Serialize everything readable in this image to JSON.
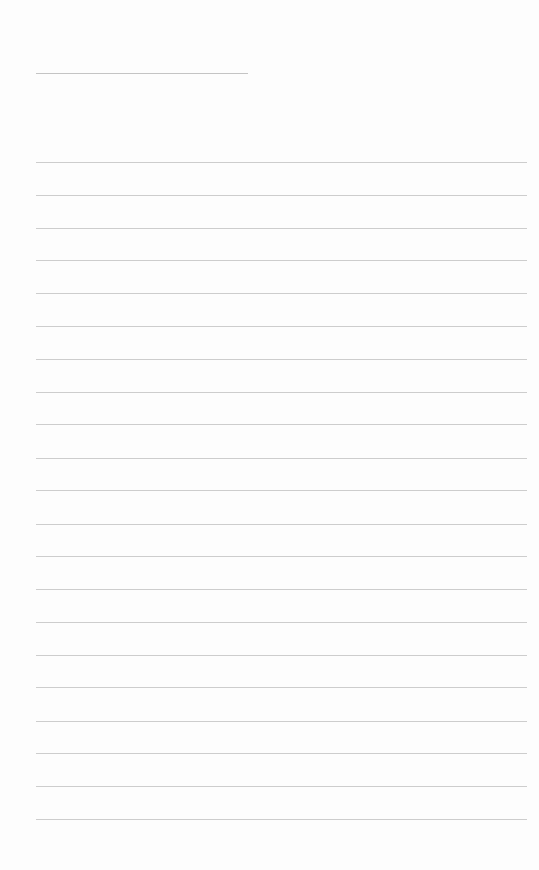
{
  "page": {
    "type": "lined-paper",
    "background_color": "#fdfdfd",
    "line_color": "#cdcdcd",
    "header_line": {
      "x1": 36,
      "x2": 248,
      "y": 73
    },
    "body_lines": {
      "x1": 36,
      "x2": 527,
      "y_positions": [
        162,
        195,
        228,
        260,
        293,
        326,
        359,
        392,
        424,
        458,
        490,
        524,
        556,
        589,
        622,
        655,
        687,
        721,
        753,
        786,
        819
      ]
    },
    "text": ""
  }
}
